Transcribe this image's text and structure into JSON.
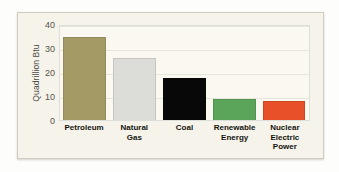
{
  "chart_data": {
    "type": "bar",
    "title": "",
    "subtitle": "",
    "xlabel": "",
    "ylabel": "Quadrillion Btu",
    "ylim": [
      0,
      40
    ],
    "yticks": [
      0,
      10,
      20,
      30,
      40
    ],
    "ytick_labels": [
      "0",
      "10",
      "20",
      "30",
      "40"
    ],
    "grid": true,
    "legend": false,
    "legend_position": "none",
    "categories": [
      "Petroleum",
      "Natural Gas",
      "Coal",
      "Renewable Energy",
      "Nuclear Electric Power"
    ],
    "category_label_lines": [
      [
        "Petroleum"
      ],
      [
        "Natural",
        "Gas"
      ],
      [
        "Coal"
      ],
      [
        "Renewable",
        "Energy"
      ],
      [
        "Nuclear",
        "Electric",
        "Power"
      ]
    ],
    "values": [
      34.4,
      25.9,
      17.4,
      8.9,
      8.1
    ],
    "bar_colors": [
      "#a39a66",
      "#dcdcd8",
      "#080808",
      "#5aa55a",
      "#e8502a"
    ]
  },
  "style": {
    "page_background": "#fdfdfb",
    "card_background": "#f5f3ea",
    "card_border": "#cfcdc2",
    "plot_background": "#faf8f0",
    "plot_border": "#dcdfd9",
    "gridline_color": "#e6e6dc",
    "tick_text_color": "#55534d",
    "axis_title_color": "#4a4a46",
    "category_text_color": "#15130f"
  }
}
